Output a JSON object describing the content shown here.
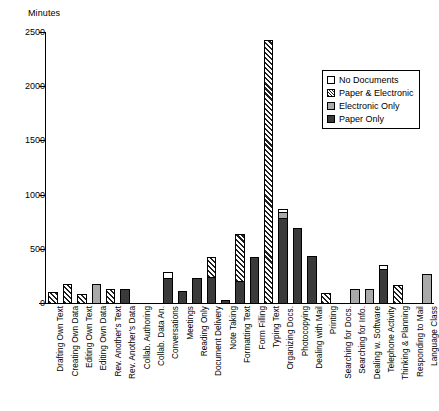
{
  "chart_data": {
    "type": "bar",
    "stacked": true,
    "title": "",
    "xlabel": "",
    "ylabel": "Minutes",
    "ylim": [
      0,
      2500
    ],
    "yticks": [
      0,
      500,
      1000,
      1500,
      2000,
      2500
    ],
    "ytick_labels": [
      "0",
      "500",
      "1000",
      "1500",
      "2000",
      "2500"
    ],
    "grid": false,
    "legend_position": "upper right",
    "legend": [
      {
        "key": "none",
        "label": "No Documents",
        "color": "#ffffff"
      },
      {
        "key": "mixed",
        "label": "Paper & Electronic",
        "color": "#1f1f1f"
      },
      {
        "key": "electronic",
        "label": "Electronic Only",
        "color": "#a9a9a9"
      },
      {
        "key": "paper",
        "label": "Paper Only",
        "color": "#3a3a3a"
      }
    ],
    "categories": [
      "Drafting Own Text",
      "Creating Own Data",
      "Editing Own Text",
      "Editing Own Data",
      "Rev. Another's Text",
      "Rev. Another's Data",
      "Collab. Authoring",
      "Collab. Data An.",
      "Conversations",
      "Meetings",
      "Reading Only",
      "Document Delivery",
      "Note Taking",
      "Formatting Text",
      "Form Filling",
      "Typing Text",
      "Organizing Docs.",
      "Photocopying",
      "Dealing with Mail",
      "Printing",
      "Searching for Docs.",
      "Searching for Info.",
      "Dealing w. Software",
      "Telephone Activity",
      "Thinking & Planning",
      "Responding to Mail",
      "Language Class"
    ],
    "series": [
      {
        "name": "Paper Only",
        "key": "paper",
        "values": [
          0,
          0,
          0,
          0,
          0,
          130,
          0,
          0,
          230,
          110,
          230,
          240,
          30,
          200,
          420,
          0,
          780,
          690,
          430,
          0,
          0,
          0,
          0,
          310,
          0,
          0,
          0
        ]
      },
      {
        "name": "Electronic Only",
        "key": "electronic",
        "values": [
          0,
          0,
          0,
          175,
          0,
          0,
          0,
          0,
          0,
          0,
          0,
          0,
          0,
          0,
          0,
          0,
          60,
          0,
          0,
          0,
          0,
          130,
          130,
          0,
          0,
          0,
          270
        ]
      },
      {
        "name": "Paper & Electronic",
        "key": "mixed",
        "values": [
          105,
          175,
          85,
          0,
          130,
          0,
          0,
          0,
          0,
          0,
          0,
          180,
          0,
          440,
          0,
          2430,
          0,
          0,
          0,
          95,
          0,
          0,
          0,
          0,
          170,
          0,
          0
        ]
      },
      {
        "name": "No Documents",
        "key": "none",
        "values": [
          0,
          0,
          0,
          0,
          0,
          0,
          0,
          0,
          60,
          0,
          0,
          0,
          0,
          0,
          0,
          0,
          30,
          0,
          0,
          0,
          0,
          0,
          0,
          40,
          0,
          0,
          0
        ]
      }
    ]
  }
}
